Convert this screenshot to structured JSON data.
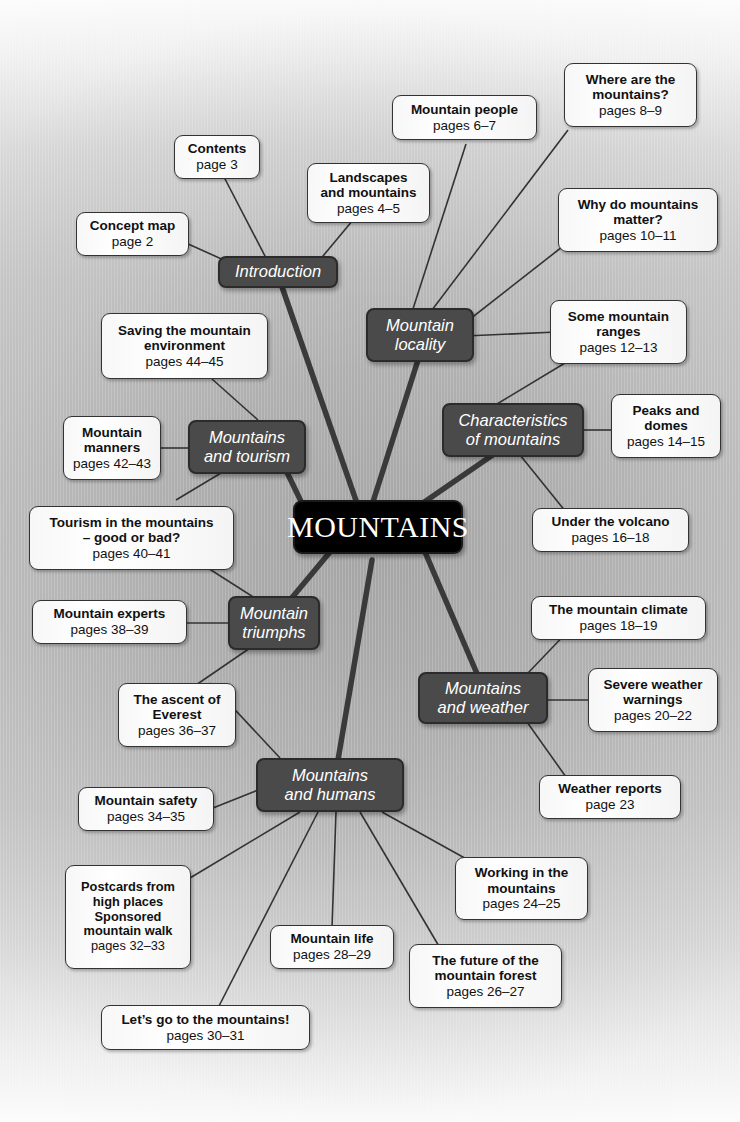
{
  "colors": {
    "center_bg": "#000000",
    "branch_bg": "#4a4a4a",
    "leaf_bg": "#f7f7f7",
    "line_thick": "#3a3a3a",
    "line_thin": "#333333",
    "text_light": "#ffffff",
    "text_dark": "#111111"
  },
  "center": {
    "label": "MOUNTAINS"
  },
  "branches": [
    {
      "id": "introduction",
      "label": "Introduction"
    },
    {
      "id": "mountain-locality",
      "label": "Mountain\nlocality"
    },
    {
      "id": "characteristics-of-mountains",
      "label": "Characteristics\nof mountains"
    },
    {
      "id": "mountains-and-weather",
      "label": "Mountains\nand weather"
    },
    {
      "id": "mountains-and-humans",
      "label": "Mountains\nand humans"
    },
    {
      "id": "mountain-triumphs",
      "label": "Mountain\ntriumphs"
    },
    {
      "id": "mountains-and-tourism",
      "label": "Mountains\nand tourism"
    }
  ],
  "leaves": [
    {
      "id": "concept-map",
      "title": "Concept map",
      "pages": "page 2"
    },
    {
      "id": "contents",
      "title": "Contents",
      "pages": "page 3"
    },
    {
      "id": "landscapes",
      "title": "Landscapes\nand mountains",
      "pages": "pages 4–5"
    },
    {
      "id": "mountain-people",
      "title": "Mountain people",
      "pages": "pages 6–7"
    },
    {
      "id": "where-are",
      "title": "Where are the\nmountains?",
      "pages": "pages 8–9"
    },
    {
      "id": "why-matter",
      "title": "Why do mountains\nmatter?",
      "pages": "pages 10–11"
    },
    {
      "id": "some-ranges",
      "title": "Some mountain\nranges",
      "pages": "pages 12–13"
    },
    {
      "id": "peaks-domes",
      "title": "Peaks and\ndomes",
      "pages": "pages 14–15"
    },
    {
      "id": "under-volcano",
      "title": "Under the volcano",
      "pages": "pages 16–18"
    },
    {
      "id": "mountain-climate",
      "title": "The mountain climate",
      "pages": "pages 18–19"
    },
    {
      "id": "severe-weather",
      "title": "Severe weather\nwarnings",
      "pages": "pages 20–22"
    },
    {
      "id": "weather-reports",
      "title": "Weather reports",
      "pages": "page 23"
    },
    {
      "id": "working-in",
      "title": "Working in the\nmountains",
      "pages": "pages 24–25"
    },
    {
      "id": "future-forest",
      "title": "The future of the\nmountain forest",
      "pages": "pages 26–27"
    },
    {
      "id": "mountain-life",
      "title": "Mountain life",
      "pages": "pages 28–29"
    },
    {
      "id": "lets-go",
      "title": "Let’s go to the mountains!",
      "pages": "pages 30–31"
    },
    {
      "id": "postcards",
      "title": "Postcards from\nhigh places\nSponsored\nmountain walk",
      "pages": "pages 32–33"
    },
    {
      "id": "mountain-safety",
      "title": "Mountain safety",
      "pages": "pages 34–35"
    },
    {
      "id": "ascent-everest",
      "title": "The ascent of\nEverest",
      "pages": "pages 36–37"
    },
    {
      "id": "mountain-experts",
      "title": "Mountain experts",
      "pages": "pages 38–39"
    },
    {
      "id": "tourism-good-bad",
      "title": "Tourism in the mountains\n– good or bad?",
      "pages": "pages 40–41"
    },
    {
      "id": "mountain-manners",
      "title": "Mountain\nmanners",
      "pages": "pages 42–43"
    },
    {
      "id": "saving-environment",
      "title": "Saving the mountain\nenvironment",
      "pages": "pages 44–45"
    }
  ]
}
